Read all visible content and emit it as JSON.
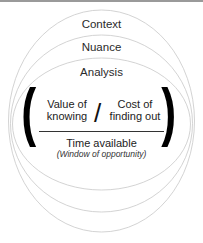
{
  "diagram": {
    "layers": [
      {
        "label": "Context"
      },
      {
        "label": "Nuance"
      },
      {
        "label": "Analysis"
      }
    ],
    "fraction": {
      "numerator_left": {
        "line1": "Value of",
        "line2": "knowing"
      },
      "operator": "/",
      "numerator_right": {
        "line1": "Cost of",
        "line2": "finding out"
      },
      "denominator": "Time available",
      "denominator_note": "(Window of opportunity)"
    },
    "colors": {
      "ellipse_stroke": "#c8c8c8",
      "paren": "#000000",
      "text": "#222222",
      "top_rule": "#9a9a9a"
    }
  }
}
